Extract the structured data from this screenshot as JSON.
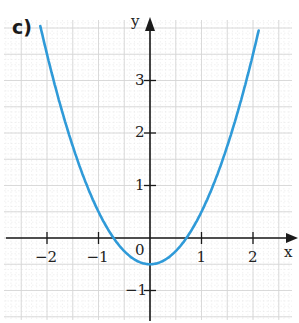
{
  "part_label": "c)",
  "chart_data": {
    "type": "line",
    "title": "",
    "xlabel": "x",
    "ylabel": "y",
    "xlim": [
      -2.9,
      2.85
    ],
    "ylim": [
      -1.6,
      4.2
    ],
    "x_ticks": [
      -2,
      -1,
      1,
      2
    ],
    "y_ticks": [
      -1,
      1,
      2,
      3
    ],
    "x_tick_labels": [
      "−2",
      "−1",
      "1",
      "2"
    ],
    "y_tick_labels": [
      "−1",
      "1",
      "2",
      "3"
    ],
    "origin_label": "0",
    "grid": true,
    "legend": null,
    "series": [
      {
        "name": "parabola",
        "function": "y = x^2 - 0.5",
        "color": "#2f9ad8",
        "x": [
          -2.12,
          -2,
          -1.5,
          -1,
          -0.71,
          -0.5,
          0,
          0.5,
          0.71,
          1,
          1.5,
          2,
          2.12
        ],
        "y": [
          4.0,
          3.5,
          1.75,
          0.5,
          0.0,
          -0.25,
          -0.5,
          -0.25,
          0.0,
          0.5,
          1.75,
          3.5,
          4.0
        ]
      }
    ]
  },
  "colors": {
    "curve": "#2f9ad8",
    "axis": "#1a1a1a",
    "grid_major": "#d6d6d6",
    "grid_minor": "#e8e8e8"
  }
}
